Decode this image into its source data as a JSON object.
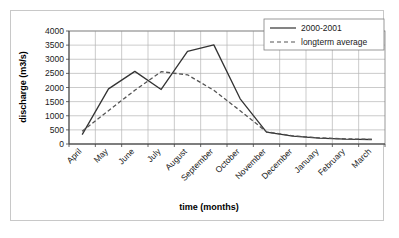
{
  "chart_data": {
    "type": "line",
    "title": "",
    "xlabel": "time (months)",
    "ylabel": "discharge (m3/s)",
    "categories": [
      "April",
      "May",
      "June",
      "July",
      "August",
      "September",
      "October",
      "November",
      "December",
      "January",
      "February",
      "March"
    ],
    "ylim": [
      0,
      4000
    ],
    "yticks": [
      0,
      500,
      1000,
      1500,
      2000,
      2500,
      3000,
      3500,
      4000
    ],
    "ytick_labels": [
      "0",
      "500",
      "1000",
      "1500",
      "2000",
      "2500",
      "3000",
      "3500",
      "4000"
    ],
    "grid": true,
    "legend_position": "top-right",
    "series": [
      {
        "name": "2000-2001",
        "style": "solid",
        "color": "#333333",
        "values": [
          330,
          1950,
          2570,
          1930,
          3280,
          3510,
          1600,
          420,
          280,
          210,
          170,
          160
        ]
      },
      {
        "name": "longterm average",
        "style": "dashed",
        "color": "#555555",
        "values": [
          450,
          1180,
          1900,
          2560,
          2450,
          1900,
          1180,
          430,
          290,
          220,
          180,
          165
        ]
      }
    ]
  },
  "legend": {
    "entries": [
      {
        "label": "2000-2001",
        "style": "solid"
      },
      {
        "label": "longterm average",
        "style": "dashed"
      }
    ]
  },
  "axes": {
    "y_title": "discharge (m3/s)",
    "x_title": "time (months)"
  }
}
